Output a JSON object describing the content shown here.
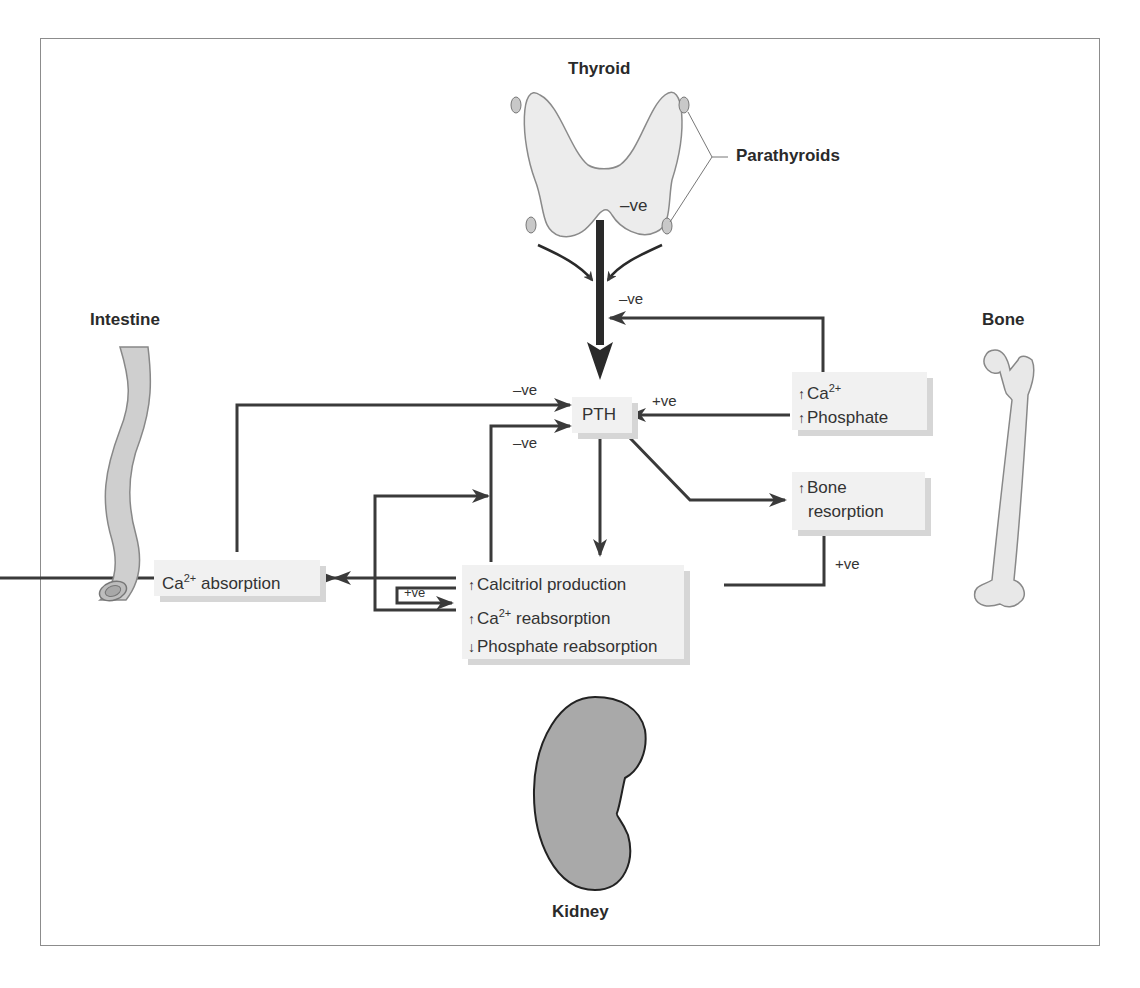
{
  "organs": {
    "thyroid": "Thyroid",
    "parathyroids": "Parathyroids",
    "intestine": "Intestine",
    "bone": "Bone",
    "kidney": "Kidney"
  },
  "boxes": {
    "pth": "PTH",
    "ca_phosphate": {
      "line1_arrow": "↑",
      "line1_text": "Ca",
      "line1_sup": "2+",
      "line2_arrow": "↑",
      "line2_text": "Phosphate"
    },
    "bone_resorption": {
      "line1_arrow": "↑",
      "line1_text": "Bone",
      "line2_text": "resorption"
    },
    "ca_absorption": {
      "text": "Ca",
      "sup": "2+",
      "suffix": " absorption"
    },
    "kidney_effects": {
      "line1_arrow": "↑",
      "line1_text": "Calcitriol production",
      "line2_arrow": "↑",
      "line2_text": "Ca",
      "line2_sup": "2+",
      "line2_suffix": " reabsorption",
      "line3_arrow": "↓",
      "line3_text": "Phosphate reabsorption"
    }
  },
  "signs": {
    "thyroid_neg": "–ve",
    "feedback_neg_top": "–ve",
    "intestine_neg": "–ve",
    "calcitriol_neg": "–ve",
    "ca_phos_pos": "+ve",
    "bone_pos": "+ve",
    "kidney_loop_pos": "+ve"
  },
  "colors": {
    "arrow": "#3a3a3a",
    "box_fill": "#f1f1f1",
    "box_shadow": "#d6d6d6",
    "organ_fill": "#e6e6e6",
    "kidney_fill": "#a9a9a9",
    "intestine_fill": "#cfcfcf"
  }
}
